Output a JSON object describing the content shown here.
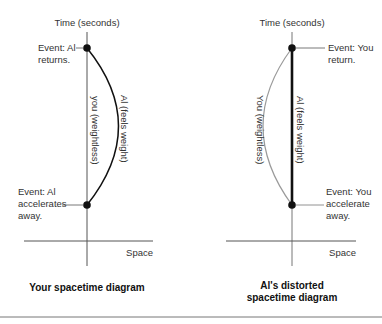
{
  "colors": {
    "axis": "#555555",
    "worldline_dark": "#111111",
    "worldline_light": "#9a9a9a",
    "event_dot": "#111111",
    "divider": "#777777"
  },
  "left_diagram": {
    "time_axis_label": "Time (seconds)",
    "space_axis_label": "Space",
    "event_top": {
      "line1": "Event: Al",
      "line2": "returns."
    },
    "event_bottom": {
      "line1": "Event: Al",
      "line2": "accelerates",
      "line3": "away."
    },
    "straight_worldline_label": "you (weightless)",
    "curved_worldline_label": "Al (feels weight)",
    "caption": "Your spacetime diagram"
  },
  "right_diagram": {
    "time_axis_label": "Time (seconds)",
    "space_axis_label": "Space",
    "event_top": {
      "line1": "Event: You",
      "line2": "return."
    },
    "event_bottom": {
      "line1": "Event: You",
      "line2": "accelerate",
      "line3": "away."
    },
    "curved_worldline_label": "You (weightless)",
    "straight_worldline_label": "Al (feels weight)",
    "caption_line1": "Al's distorted",
    "caption_line2": "spacetime diagram"
  }
}
